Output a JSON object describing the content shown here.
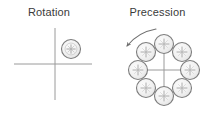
{
  "figure": {
    "background_color": "#ffffff",
    "stroke_color": "#8c8c8c",
    "text_color": "#3a3a3a",
    "circle_fill": "#f2f2f2",
    "panels": [
      {
        "id": "rotation",
        "title": "Rotation",
        "axes": {
          "type": "cross",
          "origin_x": 55,
          "origin_y": 64,
          "x_start": 14,
          "x_end": 92,
          "y_start": 28,
          "y_end": 100
        },
        "bodies": [
          {
            "label": "spinning-body",
            "cx": 71,
            "cy": 49,
            "r": 9.5,
            "marker": "cross"
          }
        ]
      },
      {
        "id": "precession",
        "title": "Precession",
        "axes": {
          "type": "cross",
          "origin_x": 164,
          "origin_y": 70,
          "x_start": 138,
          "x_end": 190,
          "y_start": 44,
          "y_end": 96
        },
        "ring": {
          "center_x": 164,
          "center_y": 70,
          "ring_radius": 26,
          "body_radius": 9.5,
          "count": 8,
          "marker": "cross"
        },
        "bodies": [
          {
            "label": "body-top",
            "cx": 164,
            "cy": 44,
            "r": 9.5,
            "marker": "cross"
          },
          {
            "label": "body-top-right",
            "cx": 182,
            "cy": 52,
            "r": 9.5,
            "marker": "cross"
          },
          {
            "label": "body-right",
            "cx": 190,
            "cy": 70,
            "r": 9.5,
            "marker": "cross"
          },
          {
            "label": "body-bottom-right",
            "cx": 182,
            "cy": 88,
            "r": 9.5,
            "marker": "cross"
          },
          {
            "label": "body-bottom",
            "cx": 164,
            "cy": 96,
            "r": 9.5,
            "marker": "cross"
          },
          {
            "label": "body-bottom-left",
            "cx": 146,
            "cy": 88,
            "r": 9.5,
            "marker": "cross"
          },
          {
            "label": "body-left",
            "cx": 138,
            "cy": 70,
            "r": 9.5,
            "marker": "cross"
          },
          {
            "label": "body-top-left",
            "cx": 146,
            "cy": 52,
            "r": 9.5,
            "marker": "cross"
          }
        ],
        "arrow": {
          "label": "precession-direction-arrow",
          "direction": "counterclockwise",
          "path": "M 156 29 C 145 31 134 37 127 46",
          "head_x": 126,
          "head_y": 47
        }
      }
    ],
    "divider": {
      "x": 103,
      "y_start": 0,
      "y_end": 115
    }
  }
}
